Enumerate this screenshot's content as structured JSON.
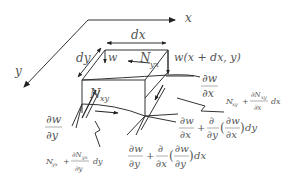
{
  "diagram": {
    "axes": {
      "x_label": "x",
      "y_label": "y"
    },
    "dimensions": {
      "dx": "dx",
      "dy": "dy"
    },
    "deflection": {
      "w": "w",
      "w_shifted": "w(x + dx, y)"
    },
    "forces": {
      "Nyx_top": {
        "base": "N",
        "sub": "yx"
      },
      "Nxy_left": {
        "base": "N",
        "sub": "xy"
      },
      "Nxy_right": {
        "base": "N",
        "sub": "xy",
        "plus": "+",
        "dnum": "∂N",
        "dnum_sub": "xy",
        "dden": "∂x",
        "tail": "dx"
      },
      "Nyx_bottom": {
        "base": "N",
        "sub": "yx",
        "plus": "+",
        "dnum": "∂N",
        "dnum_sub": "yx",
        "dden": "∂y",
        "tail": "dy"
      }
    },
    "slopes": {
      "dw_dx": {
        "num": "∂w",
        "den": "∂x"
      },
      "dw_dy": {
        "num": "∂w",
        "den": "∂y"
      },
      "dw_dx_plus": {
        "num1": "∂w",
        "den1": "∂x",
        "plus": "+",
        "num2": "∂",
        "den2": "∂y",
        "open": "(",
        "num3": "∂w",
        "den3": "∂x",
        "close": ")",
        "tail": "dy"
      },
      "dw_dy_plus": {
        "num1": "∂w",
        "den1": "∂y",
        "plus": "+",
        "num2": "∂",
        "den2": "∂x",
        "open": "(",
        "num3": "∂w",
        "den3": "∂y",
        "close": ")",
        "tail": "dx"
      }
    }
  }
}
